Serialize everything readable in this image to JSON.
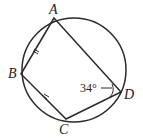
{
  "figure": {
    "type": "cyclic-quadrilateral",
    "vertices": [
      "A",
      "B",
      "C",
      "D"
    ],
    "labels": {
      "A": "A",
      "B": "B",
      "C": "C",
      "D": "D"
    },
    "angle_label": "34°",
    "angle_at": "D",
    "equal_sides": [
      "AB",
      "BC"
    ],
    "color": "#2a2a2a"
  }
}
